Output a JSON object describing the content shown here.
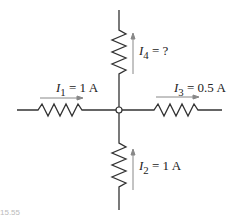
{
  "figure": {
    "caption_fragment": "15.55",
    "colors": {
      "wire": "#333333",
      "arrow": "#777777",
      "text": "#222222"
    },
    "currents": [
      {
        "id": "I1",
        "symbol": "I",
        "sub": "1",
        "value": "= 1 A",
        "direction": "right",
        "branch": "left"
      },
      {
        "id": "I2",
        "symbol": "I",
        "sub": "2",
        "value": "= 1 A",
        "direction": "up",
        "branch": "bottom"
      },
      {
        "id": "I3",
        "symbol": "I",
        "sub": "3",
        "value": "= 0.5 A",
        "direction": "right",
        "branch": "right"
      },
      {
        "id": "I4",
        "symbol": "I",
        "sub": "4",
        "value": "= ?",
        "direction": "up",
        "branch": "top"
      }
    ],
    "node": "junction"
  }
}
